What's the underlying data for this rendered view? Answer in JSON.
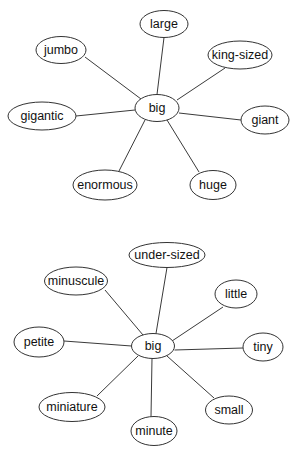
{
  "diagrams": [
    {
      "id": "big-synonyms",
      "center": {
        "label": "big",
        "cx": 157,
        "cy": 108,
        "rx": 22,
        "ry": 13.5
      },
      "nodes": [
        {
          "label": "large",
          "cx": 164,
          "cy": 24,
          "rx": 24,
          "ry": 13.5,
          "edge": [
            164,
            37.5,
            157,
            94.5
          ]
        },
        {
          "label": "jumbo",
          "cx": 61,
          "cy": 50,
          "rx": 25,
          "ry": 13.5,
          "edge": [
            85,
            57,
            141,
            99
          ]
        },
        {
          "label": "king-sized",
          "cx": 240,
          "cy": 55,
          "rx": 32,
          "ry": 14,
          "edge": [
            225,
            68,
            177,
            100
          ]
        },
        {
          "label": "gigantic",
          "cx": 42,
          "cy": 116,
          "rx": 34,
          "ry": 14,
          "edge": [
            76,
            116,
            135,
            110
          ]
        },
        {
          "label": "giant",
          "cx": 265,
          "cy": 120,
          "rx": 24,
          "ry": 14,
          "edge": [
            241,
            120,
            179,
            113
          ]
        },
        {
          "label": "enormous",
          "cx": 105,
          "cy": 185,
          "rx": 32,
          "ry": 15,
          "edge": [
            119,
            171,
            145,
            120
          ]
        },
        {
          "label": "huge",
          "cx": 213,
          "cy": 185,
          "rx": 23,
          "ry": 14.5,
          "edge": [
            199,
            172,
            167,
            120
          ]
        }
      ]
    },
    {
      "id": "small-words",
      "center": {
        "label": "big",
        "cx": 153,
        "cy": 346,
        "rx": 21.5,
        "ry": 12.5
      },
      "nodes": [
        {
          "label": "under-sized",
          "cx": 167,
          "cy": 255,
          "rx": 38,
          "ry": 12.5,
          "edge": [
            167,
            267.5,
            156,
            333.5
          ]
        },
        {
          "label": "minuscule",
          "cx": 76,
          "cy": 281,
          "rx": 31.5,
          "ry": 14,
          "edge": [
            105,
            290,
            143,
            335
          ]
        },
        {
          "label": "little",
          "cx": 236,
          "cy": 294,
          "rx": 21,
          "ry": 14,
          "edge": [
            223,
            307,
            172,
            341
          ]
        },
        {
          "label": "petite",
          "cx": 39,
          "cy": 342,
          "rx": 25,
          "ry": 15,
          "edge": [
            64,
            341,
            131.5,
            346
          ]
        },
        {
          "label": "tiny",
          "cx": 263,
          "cy": 347,
          "rx": 20,
          "ry": 14,
          "edge": [
            243,
            348,
            174.5,
            350
          ]
        },
        {
          "label": "miniature",
          "cx": 72,
          "cy": 407,
          "rx": 33,
          "ry": 14.5,
          "edge": [
            97,
            396,
            138,
            356
          ]
        },
        {
          "label": "minute",
          "cx": 154,
          "cy": 431,
          "rx": 23,
          "ry": 14.5,
          "edge": [
            151,
            416.5,
            152,
            358.5
          ]
        },
        {
          "label": "small",
          "cx": 229,
          "cy": 410,
          "rx": 23.5,
          "ry": 14,
          "edge": [
            214,
            398,
            167,
            356
          ]
        }
      ]
    }
  ],
  "colors": {
    "stroke": "#333333",
    "edge": "#3a3a3a",
    "text": "#111111",
    "fill": "#ffffff",
    "background": "#ffffff"
  }
}
